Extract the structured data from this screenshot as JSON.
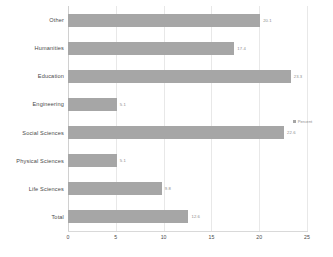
{
  "chart_data": {
    "type": "bar",
    "orientation": "horizontal",
    "title": "",
    "xlabel": "",
    "ylabel": "",
    "categories": [
      "Other",
      "Humanities",
      "Education",
      "Engineering",
      "Social Sciences",
      "Physical Sciences",
      "Life Sciences",
      "Total"
    ],
    "values": [
      20.1,
      17.4,
      23.3,
      5.1,
      22.6,
      5.1,
      9.8,
      12.6
    ],
    "data_labels": [
      "20.1",
      "17.4",
      "23.3",
      "5.1",
      "22.6",
      "5.1",
      "9.8",
      "12.6"
    ],
    "series": [
      {
        "name": "Percent",
        "values": [
          20.1,
          17.4,
          23.3,
          5.1,
          22.6,
          5.1,
          9.8,
          12.6
        ],
        "color": "#a6a6a6"
      }
    ],
    "xlim": [
      0,
      25
    ],
    "xticks": [
      0,
      5,
      10,
      15,
      20,
      25
    ],
    "xtick_labels": [
      "0",
      "5",
      "10",
      "15",
      "20",
      "25"
    ],
    "grid": true,
    "grid_axis": "x",
    "legend": {
      "position": "right",
      "entries": [
        {
          "label": "Percent",
          "color": "#a6a6a6"
        }
      ]
    }
  },
  "colors": {
    "bar_fill": "#a6a6a6",
    "gridline": "#e8e8e8",
    "axis_line": "#d9d9d9",
    "label_text": "#4a4a4a",
    "value_text": "#8c8c8c",
    "background": "#ffffff"
  }
}
